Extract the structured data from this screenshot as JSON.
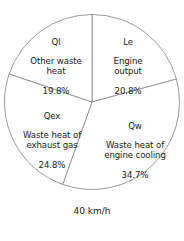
{
  "figure": {
    "caption": "40 km/h"
  },
  "chart_data": {
    "type": "pie",
    "title": "",
    "subtitle": "",
    "xlabel": "",
    "ylabel": "",
    "annotation": "40 km/h",
    "units": "percent",
    "total": 100.1,
    "start_angle_deg": 0,
    "direction": "clockwise",
    "grid": false,
    "legend": "none",
    "labels_inside_slices": true,
    "stroke_color": "#909090",
    "fill_color": "#ffffff",
    "categories": [
      "Le",
      "Qw",
      "Qex",
      "Ql"
    ],
    "values": [
      20.8,
      34.7,
      24.8,
      19.8
    ],
    "slices": [
      {
        "key": "Le",
        "description": "Engine\noutput",
        "percent": 20.8,
        "percent_label": "20.8%",
        "position": "top-right"
      },
      {
        "key": "Qw",
        "description": "Waste heat of\nengine cooling",
        "percent": 34.7,
        "percent_label": "34.7%",
        "position": "bottom-right"
      },
      {
        "key": "Qex",
        "description": "Waste heat of\nexhaust gas",
        "percent": 24.8,
        "percent_label": "24.8%",
        "position": "bottom-left"
      },
      {
        "key": "Ql",
        "description": "Other waste\nheat",
        "percent": 19.8,
        "percent_label": "19.8%",
        "position": "top-left"
      }
    ]
  }
}
